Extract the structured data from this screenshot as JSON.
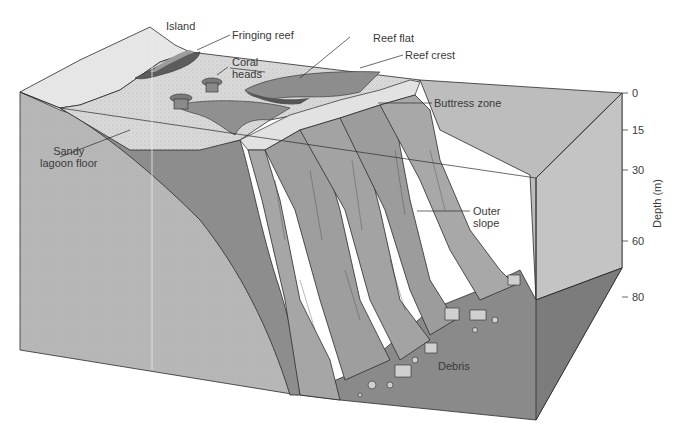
{
  "figure": {
    "colors": {
      "background": "#ffffff",
      "box_side": "#b9b9b9",
      "box_side_dark": "#9d9d9d",
      "lagoon_floor": "#d8d8d8",
      "island": "#e4e4e4",
      "reef_dark": "#6a6a6a",
      "reef_mid": "#8f8f8f",
      "slope": "#a6a6a6",
      "seafloor": "#8e8e8e",
      "outline": "#2b2b2b",
      "text": "#3a3a3a"
    }
  },
  "labels": {
    "island": "Island",
    "fringing_reef": "Fringing reef",
    "coral_heads_line1": "Coral",
    "coral_heads_line2": "heads",
    "reef_flat": "Reef flat",
    "reef_crest": "Reef crest",
    "buttress_zone": "Buttress zone",
    "sandy_lagoon_line1": "Sandy",
    "sandy_lagoon_line2": "lagoon floor",
    "outer_slope_line1": "Outer",
    "outer_slope_line2": "slope",
    "debris": "Debris"
  },
  "depth_axis": {
    "title": "Depth (m)",
    "ticks": [
      "0",
      "15",
      "30",
      "60",
      "80"
    ]
  }
}
